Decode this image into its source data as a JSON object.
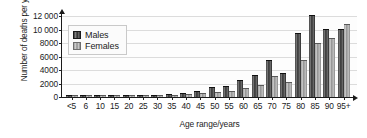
{
  "chart_data": {
    "type": "bar",
    "title": "",
    "xlabel": "Age range/years",
    "ylabel": "Number of deaths per year",
    "categories": [
      "<5",
      "6",
      "10",
      "15",
      "20",
      "25",
      "30",
      "35",
      "40",
      "45",
      "50",
      "55",
      "60",
      "65",
      "70",
      "75",
      "80",
      "85",
      "90",
      "95+"
    ],
    "ylim": [
      0,
      12000
    ],
    "yticks": [
      0,
      2000,
      4000,
      6000,
      8000,
      10000,
      12000
    ],
    "ytick_labels": [
      "0",
      "2000",
      "4000",
      "6000",
      "8000",
      "10 000",
      "12 000"
    ],
    "grid": true,
    "legend_position": "upper-left-inside",
    "series": [
      {
        "name": "Males",
        "color": "#3a3a3a",
        "values": [
          60,
          40,
          40,
          70,
          110,
          120,
          160,
          230,
          430,
          700,
          1300,
          1500,
          2350,
          3100,
          5300,
          3450,
          9400,
          12000,
          9900,
          9900
        ]
      },
      {
        "name": "Females",
        "color": "#b5b5b5",
        "values": [
          50,
          35,
          35,
          60,
          80,
          90,
          110,
          150,
          260,
          400,
          620,
          720,
          1180,
          1700,
          2900,
          2150,
          5400,
          7900,
          8600,
          10600
        ]
      }
    ],
    "note": "Paired bars per age band; males darker, females lighter"
  },
  "legend": {
    "items": [
      {
        "label": "Males"
      },
      {
        "label": "Females"
      }
    ]
  },
  "axes": {
    "y_title": "Number of deaths per year",
    "x_title": "Age range/years"
  }
}
